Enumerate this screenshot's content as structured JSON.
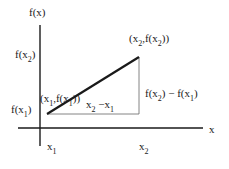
{
  "diagram": {
    "axes": {
      "y_label": "f(x)",
      "x_label": "x"
    },
    "y_ticks": [
      {
        "base": "f(x",
        "sub": "2",
        "close": ")"
      },
      {
        "base": "f(x",
        "sub": "1",
        "close": ")"
      }
    ],
    "x_ticks": [
      {
        "base": "x",
        "sub": "1"
      },
      {
        "base": "x",
        "sub": "2"
      }
    ],
    "points": {
      "p1": {
        "open": "(x",
        "sub1": "1",
        "mid": ",f(x",
        "sub2": "1",
        "close": "))"
      },
      "p2": {
        "open": "(x",
        "sub1": "2",
        "mid": ",f(x",
        "sub2": "2",
        "close": "))"
      }
    },
    "run_label": {
      "a": "x",
      "a_sub": "2",
      "op": " −x",
      "b_sub": "1"
    },
    "rise_label": {
      "a": "f(x",
      "a_sub": "2",
      "op": ") − f(x",
      "b_sub": "1",
      "close": ")"
    },
    "colors": {
      "ink": "#1a1a1a",
      "thin": "#555555",
      "background": "#ffffff"
    }
  }
}
